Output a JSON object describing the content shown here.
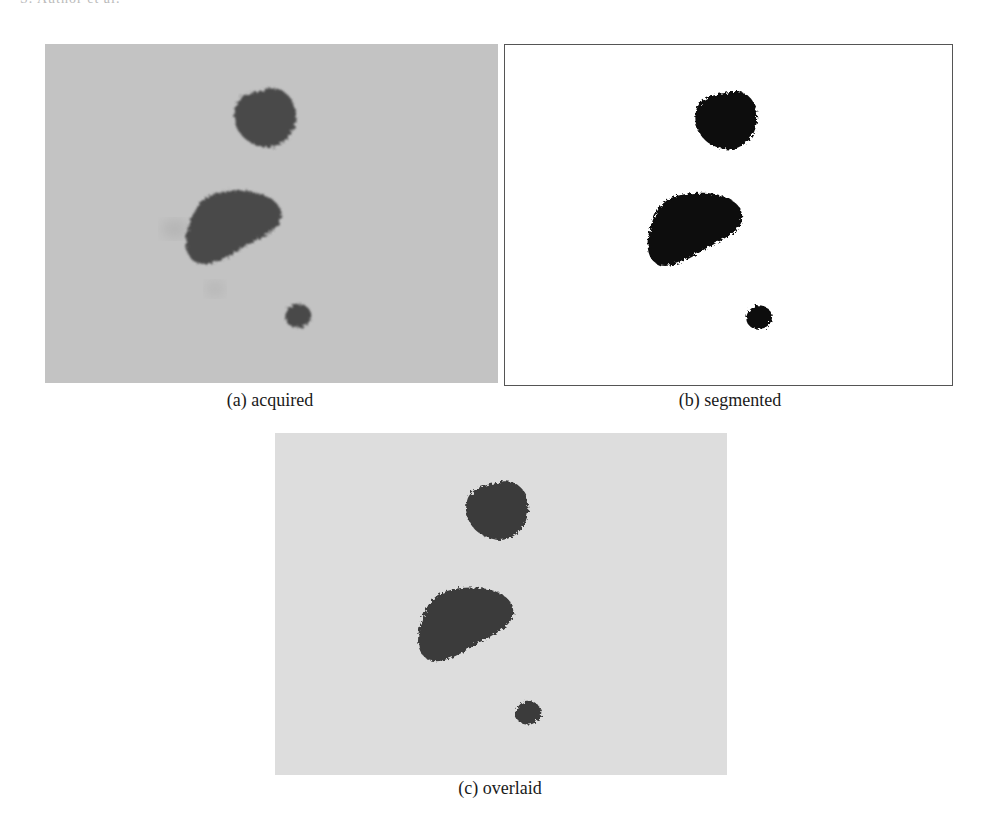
{
  "figure": {
    "running_header": "S. Author et al.",
    "panels": [
      {
        "id": "a",
        "caption": "(a) acquired",
        "style": "grayscale-photo",
        "background_color": "#c3c3c3",
        "blob_color": "#4a4a4a"
      },
      {
        "id": "b",
        "caption": "(b) segmented",
        "style": "binary-mask",
        "background_color": "#ffffff",
        "blob_color": "#0d0d0d"
      },
      {
        "id": "c",
        "caption": "(c) overlaid",
        "style": "grayscale-overlay",
        "background_color": "#dddddd",
        "blob_color": "#3a3a3a"
      }
    ],
    "objects": [
      {
        "name": "large-round-blob"
      },
      {
        "name": "elongated-blob"
      },
      {
        "name": "small-blob"
      }
    ]
  }
}
